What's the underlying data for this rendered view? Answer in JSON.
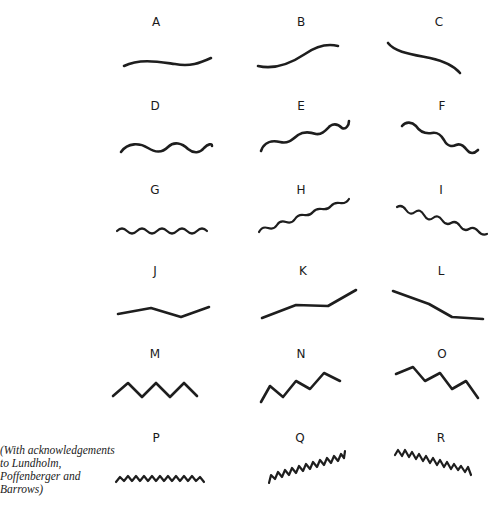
{
  "figure": {
    "caption": "(With acknowledgements to Lundholm, Poffenberger and Barrows)",
    "caption_lines": [
      "(With acknowledgements",
      "to Lundholm,",
      "Poffenberger and",
      "Barrows)"
    ],
    "stroke_color": "#1e1e1e",
    "background": "#ffffff",
    "items": [
      {
        "label": "A",
        "row": 1,
        "col": 1,
        "shape": "gentle curve, nearly horizontal"
      },
      {
        "label": "B",
        "row": 1,
        "col": 2,
        "shape": "gentle curve, rising"
      },
      {
        "label": "C",
        "row": 1,
        "col": 3,
        "shape": "gentle curve, falling"
      },
      {
        "label": "D",
        "row": 2,
        "col": 1,
        "shape": "large waves, horizontal"
      },
      {
        "label": "E",
        "row": 2,
        "col": 2,
        "shape": "large waves, rising"
      },
      {
        "label": "F",
        "row": 2,
        "col": 3,
        "shape": "large waves, falling"
      },
      {
        "label": "G",
        "row": 3,
        "col": 1,
        "shape": "small waves, horizontal"
      },
      {
        "label": "H",
        "row": 3,
        "col": 2,
        "shape": "small waves, rising"
      },
      {
        "label": "I",
        "row": 3,
        "col": 3,
        "shape": "small waves, falling"
      },
      {
        "label": "J",
        "row": 4,
        "col": 1,
        "shape": "broad angles, horizontal"
      },
      {
        "label": "K",
        "row": 4,
        "col": 2,
        "shape": "broad angles, rising"
      },
      {
        "label": "L",
        "row": 4,
        "col": 3,
        "shape": "broad angles, falling"
      },
      {
        "label": "M",
        "row": 5,
        "col": 1,
        "shape": "medium zigzag, horizontal"
      },
      {
        "label": "N",
        "row": 5,
        "col": 2,
        "shape": "medium zigzag, rising"
      },
      {
        "label": "O",
        "row": 5,
        "col": 3,
        "shape": "medium zigzag, falling"
      },
      {
        "label": "P",
        "row": 6,
        "col": 1,
        "shape": "fine zigzag, horizontal"
      },
      {
        "label": "Q",
        "row": 6,
        "col": 2,
        "shape": "fine zigzag, rising"
      },
      {
        "label": "R",
        "row": 6,
        "col": 3,
        "shape": "fine zigzag, falling"
      }
    ]
  }
}
